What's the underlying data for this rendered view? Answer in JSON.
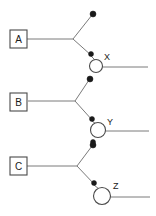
{
  "diagram": {
    "type": "branching-tree",
    "width": 156,
    "height": 216,
    "background_color": "#ffffff",
    "edge_color": "#7a7a7a",
    "node_stroke_color": "#4a4a4a",
    "dot_color": "#1a1a1a",
    "label_color": "#1a1a1a",
    "boxes": [
      {
        "label": "A",
        "x": 10,
        "y": 30,
        "w": 17,
        "h": 18
      },
      {
        "label": "B",
        "x": 10,
        "y": 93,
        "w": 17,
        "h": 18
      },
      {
        "label": "C",
        "x": 10,
        "y": 157,
        "w": 17,
        "h": 18
      }
    ],
    "junctions": [
      {
        "name": "junction-a",
        "x": 73,
        "y": 39
      },
      {
        "name": "junction-b",
        "x": 75,
        "y": 100
      },
      {
        "name": "junction-c",
        "x": 77,
        "y": 166
      }
    ],
    "dots": [
      {
        "name": "dot-a-upper",
        "x": 93,
        "y": 14,
        "r": 3
      },
      {
        "name": "dot-a-lower",
        "x": 91,
        "y": 54,
        "r": 2.5
      },
      {
        "name": "dot-b-upper",
        "x": 90,
        "y": 79,
        "r": 3
      },
      {
        "name": "dot-b-lower",
        "x": 92,
        "y": 119,
        "r": 2.5
      },
      {
        "name": "dot-b-below-circle",
        "x": 93,
        "y": 142,
        "r": 2.5
      },
      {
        "name": "dot-c-upper",
        "x": 93,
        "y": 145,
        "r": 3
      },
      {
        "name": "dot-c-lower",
        "x": 94,
        "y": 183,
        "r": 2.5
      }
    ],
    "circles": [
      {
        "label": "X",
        "cx": 96,
        "cy": 66,
        "r": 6.5,
        "label_x": 104,
        "label_y": 57,
        "tail_x2": 148
      },
      {
        "label": "Y",
        "cx": 98,
        "cy": 130,
        "r": 7.5,
        "label_x": 107,
        "label_y": 122,
        "tail_x2": 149
      },
      {
        "label": "Z",
        "cx": 102,
        "cy": 196,
        "r": 8.5,
        "label_x": 113,
        "label_y": 186,
        "tail_x2": 150
      }
    ],
    "labels": {
      "box_a": "A",
      "box_b": "B",
      "box_c": "C",
      "circle_x": "X",
      "circle_y": "Y",
      "circle_z": "Z"
    }
  }
}
